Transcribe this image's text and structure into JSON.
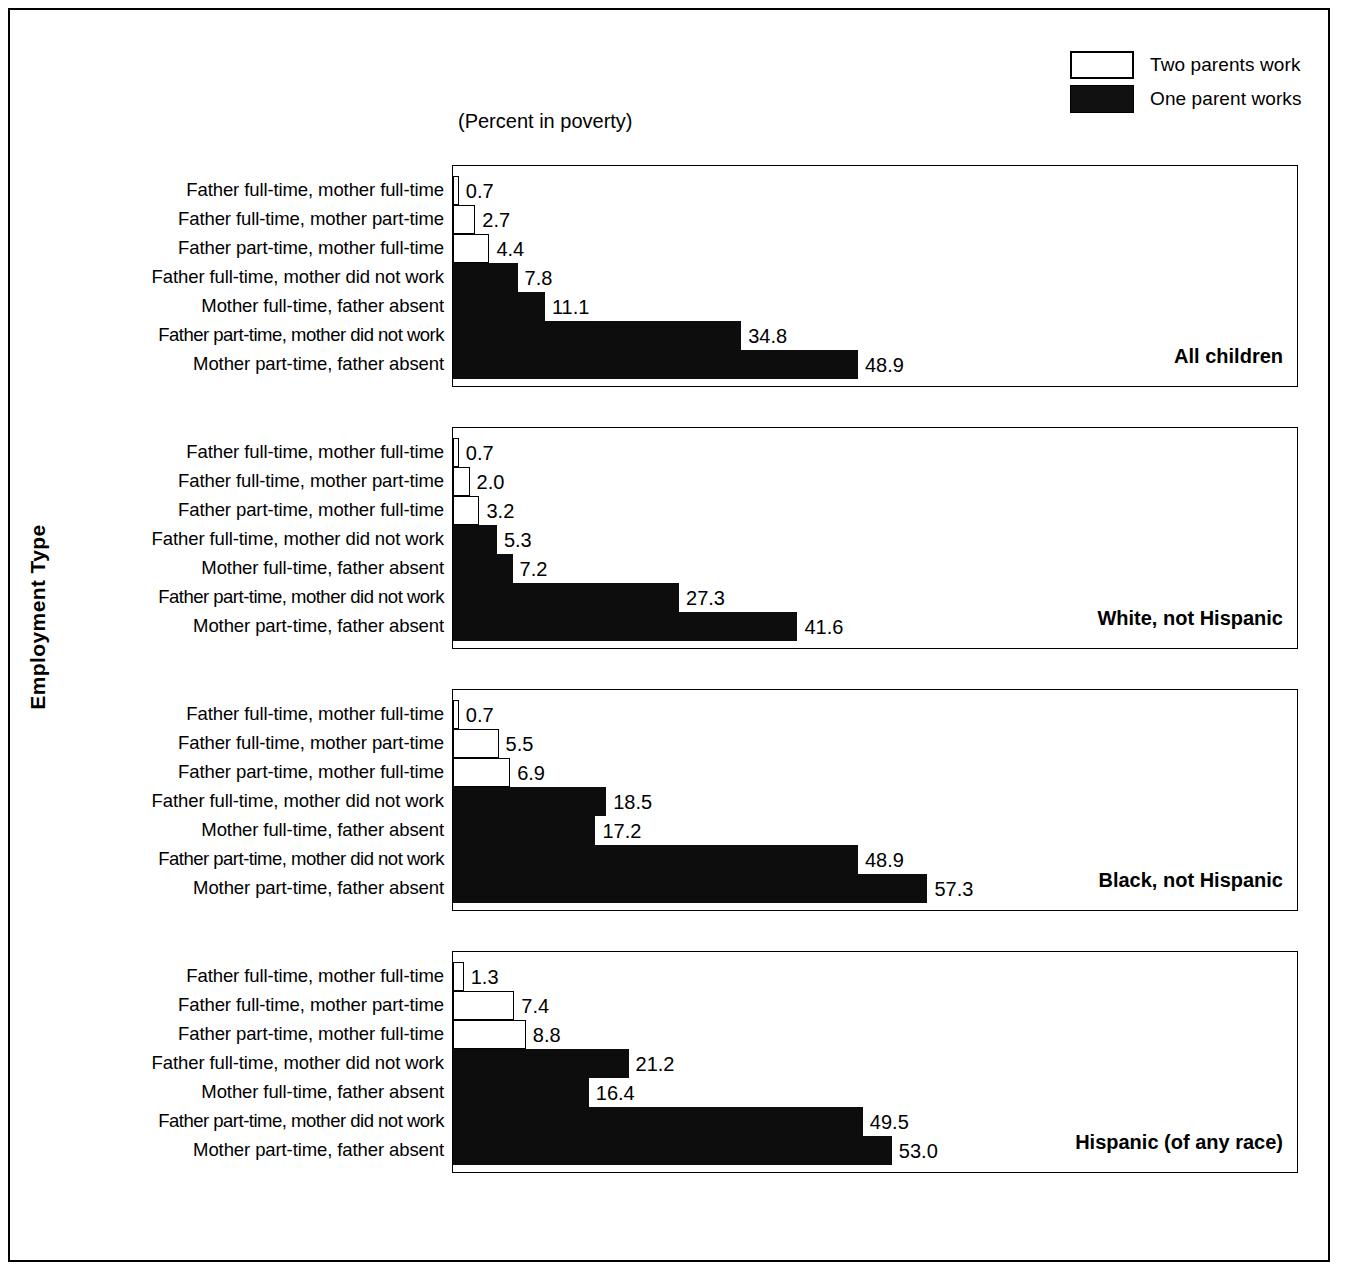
{
  "axis_title": "Employment Type",
  "caption": "(Percent in poverty)",
  "legend": {
    "items": [
      {
        "key": "two",
        "label": "Two parents work"
      },
      {
        "key": "one",
        "label": "One parent works"
      }
    ]
  },
  "categories": [
    "Father full-time, mother full-time",
    "Father full-time, mother part-time",
    "Father part-time, mother full-time",
    "Father full-time, mother did not work",
    "Mother full-time, father absent",
    "Father part-time, mother did not work",
    "Mother part-time, father absent"
  ],
  "panels": [
    {
      "title": "All children",
      "values": [
        "0.7",
        "2.7",
        "4.4",
        "7.8",
        "11.1",
        "34.8",
        "48.9"
      ]
    },
    {
      "title": "White, not Hispanic",
      "values": [
        "0.7",
        "2.0",
        "3.2",
        "5.3",
        "7.2",
        "27.3",
        "41.6"
      ]
    },
    {
      "title": "Black, not Hispanic",
      "values": [
        "0.7",
        "5.5",
        "6.9",
        "18.5",
        "17.2",
        "48.9",
        "57.3"
      ]
    },
    {
      "title": "Hispanic (of any race)",
      "values": [
        "1.3",
        "7.4",
        "8.8",
        "21.2",
        "16.4",
        "49.5",
        "53.0"
      ]
    }
  ],
  "chart_data": {
    "type": "bar",
    "orientation": "horizontal",
    "title": "(Percent in poverty)",
    "xlabel": "Percent in poverty",
    "ylabel": "Employment Type",
    "grid": false,
    "legend_position": "top-right",
    "legend": [
      "Two parents work",
      "One parent works"
    ],
    "series_style": {
      "Two parents work": {
        "fill": "#ffffff",
        "edge": "#000000"
      },
      "One parent works": {
        "fill": "#0d0d0d",
        "edge": "#000000"
      }
    },
    "categories": [
      "Father full-time, mother full-time",
      "Father full-time, mother part-time",
      "Father part-time, mother full-time",
      "Father full-time, mother did not work",
      "Mother full-time, father absent",
      "Father part-time, mother did not work",
      "Mother part-time, father absent"
    ],
    "category_group": [
      "Two parents work",
      "Two parents work",
      "Two parents work",
      "One parent works",
      "One parent works",
      "One parent works",
      "One parent works"
    ],
    "xlim": [
      0,
      100
    ],
    "panels": [
      {
        "name": "All children",
        "values": [
          0.7,
          2.7,
          4.4,
          7.8,
          11.1,
          34.8,
          48.9
        ]
      },
      {
        "name": "White, not Hispanic",
        "values": [
          0.7,
          2.0,
          3.2,
          5.3,
          7.2,
          27.3,
          41.6
        ]
      },
      {
        "name": "Black, not Hispanic",
        "values": [
          0.7,
          5.5,
          6.9,
          18.5,
          17.2,
          48.9,
          57.3
        ]
      },
      {
        "name": "Hispanic (of any race)",
        "values": [
          1.3,
          7.4,
          8.8,
          21.2,
          16.4,
          49.5,
          53.0
        ]
      }
    ]
  }
}
